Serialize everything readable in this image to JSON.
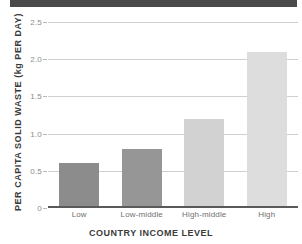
{
  "figure": {
    "top_band_color": "#4a4a4a"
  },
  "chart_data": {
    "type": "bar",
    "title": "",
    "categories": [
      "Low",
      "Low-middle",
      "High-middle",
      "High"
    ],
    "values": [
      0.58,
      0.78,
      1.18,
      2.09
    ],
    "series": [
      {
        "name": "Per capita solid waste",
        "values": [
          0.58,
          0.78,
          1.18,
          2.09
        ]
      }
    ],
    "bar_colors": [
      "#8c8c8c",
      "#969696",
      "#d2d2d2",
      "#dddddd"
    ],
    "xlabel": "COUNTRY INCOME LEVEL",
    "ylabel": "PER CAPITA SOLID WASTE (kg PER DAY)",
    "ylim": [
      0,
      2.5
    ],
    "yticks": [
      0,
      0.5,
      1.0,
      1.5,
      2.0,
      2.5
    ],
    "ytick_labels": [
      "0",
      "0.5",
      "1.0",
      "1.5",
      "2.0",
      "2.5"
    ],
    "grid": true,
    "grid_axis": "y",
    "grid_color": "#cfcfcf",
    "legend": false,
    "legend_position": "none",
    "axis_line_color": "#5a5a5a",
    "tick_label_color": "#8c8c8c",
    "axis_title_color": "#3b3b3b"
  }
}
